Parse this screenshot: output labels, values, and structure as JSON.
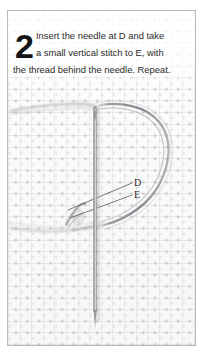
{
  "figure": {
    "type": "embroidery-instruction-illustration",
    "step_number": "2",
    "caption_lines": [
      "Insert the needle at D and take",
      "a small vertical stitch to E, with",
      "the thread behind the needle. Repeat."
    ],
    "caption_full": "Insert the needle at D and take a small vertical stitch to E, with the thread behind the needle. Repeat.",
    "point_labels": [
      {
        "id": "D",
        "text": "D"
      },
      {
        "id": "E",
        "text": "E"
      }
    ],
    "elements": {
      "needle": "sewing-needle-vertical",
      "thread_loop": "thread-loop-behind-needle",
      "fabric": "aida-cross-stitch-cloth",
      "stitch": "worked-stitch-knot"
    }
  },
  "colors": {
    "page_background": "#ffffff",
    "frame_border": "#b9b9b9",
    "fabric_base": "#fbfbfb",
    "weave_line": "#c4c4c8",
    "weave_dot": "#ababb0",
    "text": "#2a2a2a",
    "step_number": "#141414",
    "needle_body": "#9a9a9e",
    "needle_highlight": "#ffffff",
    "thread": "#8e8e94",
    "leader_line": "#4a4a4a"
  }
}
